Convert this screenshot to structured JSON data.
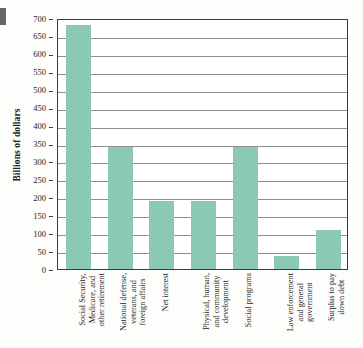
{
  "chart_data": {
    "type": "bar",
    "title": "",
    "subtitle": "",
    "xlabel": "",
    "ylabel": "Billions of dollars",
    "ylim": [
      0,
      700
    ],
    "ytick_step": 50,
    "yticks": [
      0,
      50,
      100,
      150,
      200,
      250,
      300,
      350,
      400,
      450,
      500,
      550,
      600,
      650,
      700
    ],
    "ytick_labels": [
      "0",
      "50",
      "100",
      "150",
      "200",
      "250",
      "300",
      "350",
      "400",
      "450",
      "500",
      "550",
      "600",
      "650",
      "700"
    ],
    "grid": true,
    "grid_axis": "y",
    "legend": false,
    "legend_position": "none",
    "bar_color": "#8cc9b4",
    "categories": [
      "Social Security, Medicare, and other retirement",
      "National defense, veterans, and foreign affairs",
      "Net interest",
      "Physical, human, and community development",
      "Social programs",
      "Law enforcement and general government",
      "Surplus to pay down debt"
    ],
    "category_lines": [
      [
        "Social Security,",
        "Medicare, and",
        "other retirement"
      ],
      [
        "National defense,",
        "veterans, and",
        "foreign affairs"
      ],
      [
        "Net interest"
      ],
      [
        "Physical, human,",
        "and community",
        "development"
      ],
      [
        "Social programs"
      ],
      [
        "Law enforcement",
        "and general",
        "government"
      ],
      [
        "Surplus to pay",
        "down debt"
      ]
    ],
    "values": [
      680,
      340,
      190,
      190,
      340,
      35,
      110
    ]
  },
  "axes": {
    "y_title": "Billions of dollars"
  }
}
